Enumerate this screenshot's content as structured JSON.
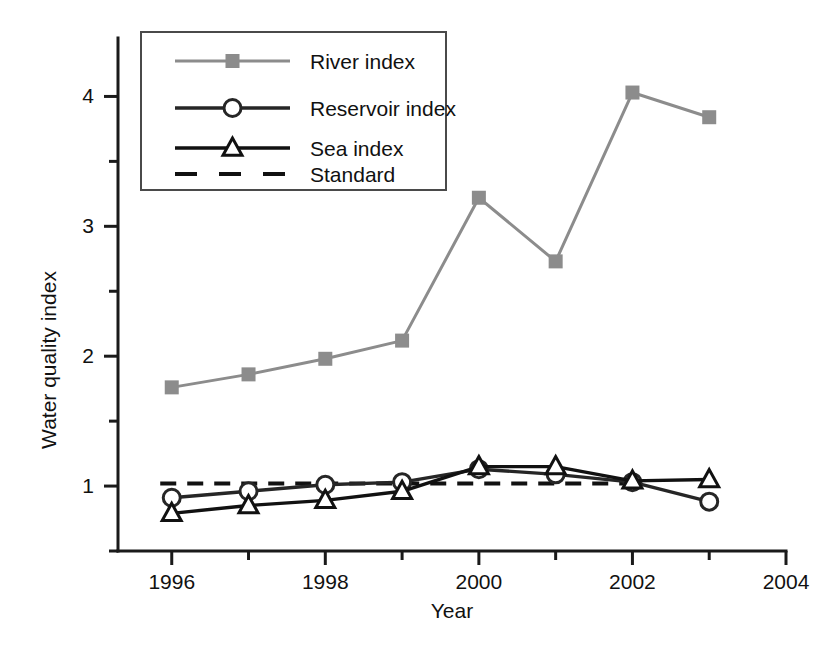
{
  "chart_data": {
    "type": "line",
    "title": "",
    "xlabel": "Year",
    "ylabel": "Water quality index",
    "xlim": [
      1995.3,
      2004.0
    ],
    "ylim": [
      0.5,
      4.45
    ],
    "grid": false,
    "legend_position": "top-left",
    "x": [
      1996,
      1997,
      1998,
      1999,
      2000,
      2001,
      2002,
      2003
    ],
    "xticks_major": [
      1996,
      1998,
      2000,
      2002,
      2004
    ],
    "xticks_major_labels": [
      "1996",
      "1998",
      "2000",
      "2002",
      "2004"
    ],
    "xticks_minor": [
      1997,
      1999,
      2001,
      2003
    ],
    "yticks_major": [
      1,
      2,
      3,
      4
    ],
    "yticks_major_labels": [
      "1",
      "2",
      "3",
      "4"
    ],
    "yticks_minor": [
      0.5,
      1.5,
      2.5,
      3.5
    ],
    "series": [
      {
        "name": "River index",
        "marker": "square-filled",
        "color": "#8c8c8c",
        "values": [
          1.76,
          1.86,
          1.98,
          2.12,
          3.22,
          2.73,
          4.03,
          3.84
        ]
      },
      {
        "name": "Reservoir index",
        "marker": "circle-open",
        "color": "#262626",
        "values": [
          0.91,
          0.96,
          1.01,
          1.03,
          1.13,
          1.09,
          1.03,
          0.88
        ]
      },
      {
        "name": "Sea index",
        "marker": "triangle-open",
        "color": "#111111",
        "values": [
          0.79,
          0.85,
          0.89,
          0.96,
          1.15,
          1.15,
          1.04,
          1.05
        ]
      }
    ],
    "reference_line": {
      "name": "Standard",
      "value": 1.02,
      "style": "dashed",
      "color": "#111111",
      "x_start": 1995.85,
      "x_end": 2002.1
    }
  },
  "legend": {
    "entries": [
      {
        "label": "River index"
      },
      {
        "label": "Reservoir index"
      },
      {
        "label": "Sea index"
      },
      {
        "label": "Standard"
      }
    ]
  },
  "axes": {
    "x_title": "Year",
    "y_title": "Water quality index"
  }
}
